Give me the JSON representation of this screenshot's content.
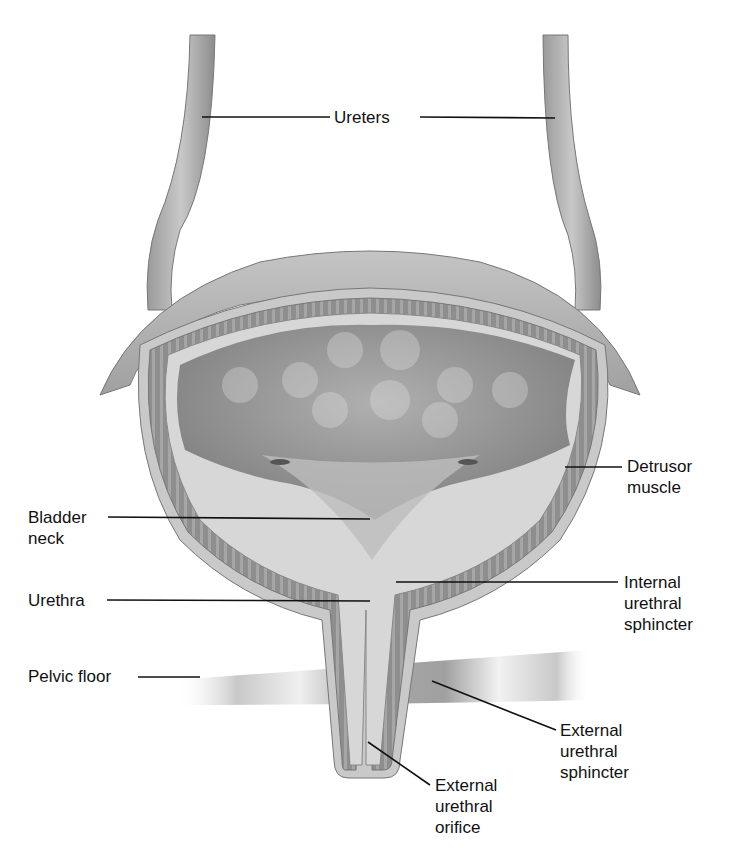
{
  "diagram": {
    "labels": {
      "ureters": "Ureters",
      "detrusor": [
        "Detrusor",
        "muscle"
      ],
      "bladder_neck": [
        "Bladder",
        "neck"
      ],
      "urethra": "Urethra",
      "internal_sphincter": [
        "Internal",
        "urethral",
        "sphincter"
      ],
      "pelvic_floor": "Pelvic floor",
      "external_sphincter": [
        "External",
        "urethral",
        "sphincter"
      ],
      "external_orifice": [
        "External",
        "urethral",
        "orifice"
      ]
    },
    "colors": {
      "background": "#ffffff",
      "tissue_outer": "#b8b8b8",
      "tissue_light": "#d9d9d9",
      "muscle_layer": "#8f8f8f",
      "lumen": "#9a9a9a",
      "leader_line": "#111111"
    }
  }
}
